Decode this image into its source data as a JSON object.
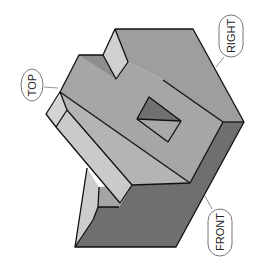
{
  "diagram": {
    "type": "isometric-view",
    "labels": {
      "top": "TOP",
      "right": "RIGHT",
      "front": "FRONT"
    },
    "colors": {
      "background": "#ffffff",
      "top_face": "#a6a6a6",
      "right_face": "#9e9e9e",
      "front_face": "#6f6f6f",
      "light_face": "#cfcfcf",
      "mid_face": "#b4b4b4",
      "hole_dark": "#707070",
      "hole_light": "#a8a8a8",
      "edge": "#111111",
      "label_border": "#777777"
    }
  }
}
